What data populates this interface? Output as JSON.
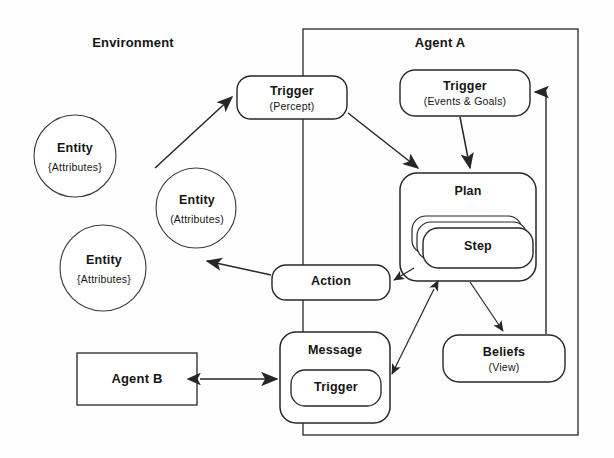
{
  "diagram": {
    "stroke_color": "#262626",
    "background_color": "#fefefe"
  },
  "regions": [
    {
      "id": "environment",
      "label": "Environment",
      "shape": "implicit-region"
    },
    {
      "id": "agent-a",
      "label": "Agent A",
      "shape": "rectangle"
    }
  ],
  "entities": [
    {
      "id": "entity-1",
      "label": "Entity",
      "sublabel": "{Attributes}"
    },
    {
      "id": "entity-2",
      "label": "Entity",
      "sublabel": "(Attributes)"
    },
    {
      "id": "entity-3",
      "label": "Entity",
      "sublabel": "{Attributes}"
    }
  ],
  "nodes": [
    {
      "id": "trigger-percept",
      "label": "Trigger",
      "sublabel": "(Percept)",
      "shape": "rounded-rect"
    },
    {
      "id": "trigger-events",
      "label": "Trigger",
      "sublabel": "(Events & Goals)",
      "shape": "rounded-rect"
    },
    {
      "id": "plan",
      "label": "Plan",
      "sublabel": "",
      "shape": "rounded-rect"
    },
    {
      "id": "step",
      "label": "Step",
      "sublabel": "",
      "shape": "rounded-rect-stack"
    },
    {
      "id": "action",
      "label": "Action",
      "sublabel": "",
      "shape": "rounded-rect"
    },
    {
      "id": "beliefs",
      "label": "Beliefs",
      "sublabel": "(View)",
      "shape": "rounded-rect"
    },
    {
      "id": "message",
      "label": "Message",
      "sublabel": "",
      "shape": "rounded-rect"
    },
    {
      "id": "message-trigger",
      "label": "Trigger",
      "sublabel": "",
      "shape": "rounded-rect"
    },
    {
      "id": "agent-b",
      "label": "Agent B",
      "sublabel": "",
      "shape": "rectangle"
    }
  ],
  "edges": [
    {
      "from": "entity-1",
      "to": "trigger-percept",
      "arrow": "single"
    },
    {
      "from": "trigger-percept",
      "to": "plan",
      "arrow": "single"
    },
    {
      "from": "trigger-events",
      "to": "plan",
      "arrow": "single"
    },
    {
      "from": "plan",
      "to": "action",
      "arrow": "single"
    },
    {
      "from": "action",
      "to": "entity-2",
      "arrow": "single"
    },
    {
      "from": "plan",
      "to": "beliefs",
      "arrow": "single"
    },
    {
      "from": "beliefs",
      "to": "trigger-events",
      "arrow": "single"
    },
    {
      "from": "plan",
      "to": "message",
      "arrow": "double"
    },
    {
      "from": "agent-b",
      "to": "message",
      "arrow": "double"
    }
  ]
}
